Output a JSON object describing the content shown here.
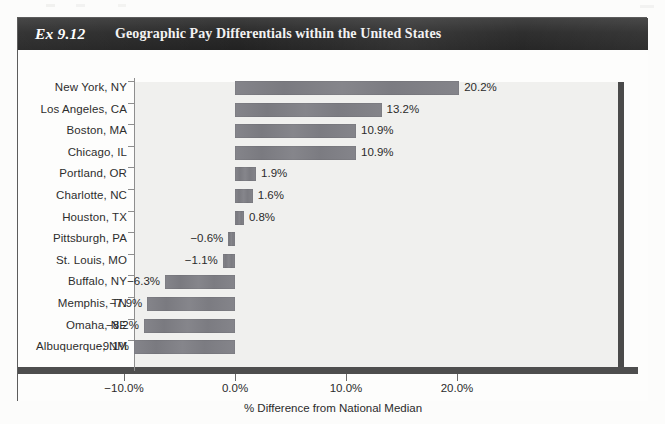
{
  "exhibit": {
    "number_label": "Ex 9.12",
    "title": "Geographic Pay Differentials within the United States"
  },
  "chart_data": {
    "type": "bar",
    "orientation": "horizontal",
    "title": "Geographic Pay Differentials within the United States",
    "xlabel": "% Difference from National Median",
    "ylabel": "",
    "xlim": [
      -13.5,
      30.5
    ],
    "xticks": [
      -10.0,
      0.0,
      10.0,
      20.0
    ],
    "xtick_labels": [
      "−10.0%",
      "0.0%",
      "10.0%",
      "20.0%"
    ],
    "grid": false,
    "legend": null,
    "bar_color": "#7e7e84",
    "plot_background": "#f0f0ee",
    "categories": [
      "New York, NY",
      "Los Angeles, CA",
      "Boston, MA",
      "Chicago, IL",
      "Portland, OR",
      "Charlotte, NC",
      "Houston, TX",
      "Pittsburgh, PA",
      "St. Louis, MO",
      "Buffalo, NY",
      "Memphis, TN",
      "Omaha, NE",
      "Albuquerque, NM"
    ],
    "values": [
      20.2,
      13.2,
      10.9,
      10.9,
      1.9,
      1.6,
      0.8,
      -0.6,
      -1.1,
      -6.3,
      -7.9,
      -8.2,
      -9.1
    ],
    "value_labels": [
      "20.2%",
      "13.2%",
      "10.9%",
      "10.9%",
      "1.9%",
      "1.6%",
      "0.8%",
      "−0.6%",
      "−1.1%",
      "−6.3%",
      "−7.9%",
      "−8.2%",
      "−9.1%"
    ]
  }
}
